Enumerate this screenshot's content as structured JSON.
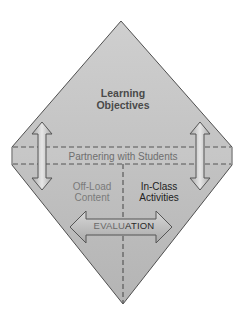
{
  "diagram": {
    "type": "diamond-framework",
    "colors": {
      "diamond_fill_top": "#c4c4c4",
      "diamond_fill_bottom": "#b6b6b6",
      "diamond_stroke": "#555555",
      "band_fill": "#c9c9c9",
      "dash_color": "#555555",
      "arrow_fill": "#bdbdbd",
      "arrow_highlight": "#e2e2e2",
      "arrow_stroke": "#555555"
    },
    "top_region": {
      "label_line1": "Learning",
      "label_line2": "Objectives"
    },
    "middle_band": {
      "label": "Partnering with Students"
    },
    "bottom_left": {
      "label_line1": "Off-Load",
      "label_line2": "Content"
    },
    "bottom_right": {
      "label_line1": "In-Class",
      "label_line2": "Activities"
    },
    "evaluation_arrow": {
      "label_left_part": "EVALU",
      "label_right_part": "ATION"
    },
    "side_arrows": {
      "left": "double-vertical-arrow",
      "right": "double-vertical-arrow"
    }
  }
}
